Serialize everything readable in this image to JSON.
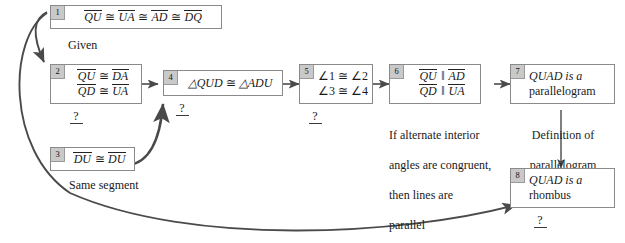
{
  "diagram": {
    "background": "#ffffff",
    "line_color": "#4a4a4a",
    "box_border": "#8a8a8a",
    "number_tab_fill": "#c9c9c9"
  },
  "steps": [
    {
      "number": "1",
      "lines": [
        "QU ≅ UA ≅ AD ≅ DQ"
      ],
      "statement": "QU ≅ UA ≅ AD ≅ DQ",
      "justification": "Given"
    },
    {
      "number": "2",
      "lines": [
        "QU ≅ DA",
        "QD ≅ UA"
      ],
      "statement": "QU ≅ DA ; QD ≅ UA",
      "justification": "?"
    },
    {
      "number": "3",
      "lines": [
        "DU ≅ DU"
      ],
      "statement": "DU ≅ DU",
      "justification": "Same segment"
    },
    {
      "number": "4",
      "lines": [
        "△QUD ≅ △ADU"
      ],
      "statement": "△QUD ≅ △ADU",
      "justification": "?"
    },
    {
      "number": "5",
      "lines": [
        "∠1 ≅ ∠2",
        "∠3 ≅ ∠4"
      ],
      "statement": "∠1 ≅ ∠2 ; ∠3 ≅ ∠4",
      "justification": "?"
    },
    {
      "number": "6",
      "lines": [
        "QU ‖ AD",
        "QD ‖ UA"
      ],
      "statement": "QU ‖ AD ; QD ‖ UA",
      "justification": "If alternate interior angles are congruent, then lines are parallel"
    },
    {
      "number": "7",
      "lines": [
        "QUAD is a",
        "parallelogram"
      ],
      "statement": "QUAD is a parallelogram",
      "justification": "Definition of parallelogram"
    },
    {
      "number": "8",
      "lines": [
        "QUAD is a",
        "rhombus"
      ],
      "statement": "QUAD is a rhombus",
      "justification": "?"
    }
  ],
  "captions": {
    "given": "Given",
    "same_segment": "Same segment",
    "alt_interior_l1": "If alternate interior",
    "alt_interior_l2": "angles are congruent,",
    "alt_interior_l3": "then lines are",
    "alt_interior_l4": "parallel",
    "def_parallelogram_l1": "Definition of",
    "def_parallelogram_l2": "parallelogram",
    "unknown": "?"
  },
  "box_text": {
    "b1_qu": "QU",
    "b1_ua": "UA",
    "b1_ad": "AD",
    "b1_dq": "DQ",
    "b2_qu": "QU",
    "b2_da": "DA",
    "b2_qd": "QD",
    "b2_ua": "UA",
    "b3_du_left": "DU",
    "b3_du_right": "DU",
    "b4_tri1": "△QUD",
    "b4_tri2": "△ADU",
    "b5_a1": "∠1",
    "b5_a2": "∠2",
    "b5_a3": "∠3",
    "b5_a4": "∠4",
    "b6_qu": "QU",
    "b6_ad": "AD",
    "b6_qd": "QD",
    "b6_ua": "UA",
    "b7_l1": "QUAD is a",
    "b7_l2": "parallelogram",
    "b8_l1": "QUAD is a",
    "b8_l2": "rhombus",
    "cong": "≅",
    "parallel": "‖"
  },
  "numbers": {
    "n1": "1",
    "n2": "2",
    "n3": "3",
    "n4": "4",
    "n5": "5",
    "n6": "6",
    "n7": "7",
    "n8": "8"
  }
}
